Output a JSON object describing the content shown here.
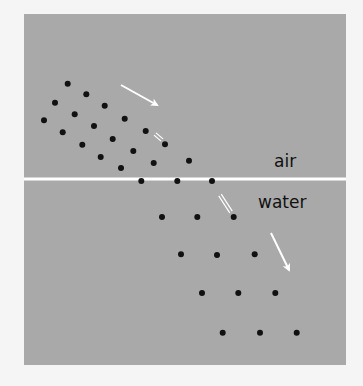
{
  "diagram": {
    "title": "",
    "panel": {
      "x": 24,
      "y": 14,
      "width": 322,
      "height": 351,
      "color": "#a9a9a9"
    },
    "interface": {
      "y": 179,
      "color": "#ffffff",
      "thickness": 3
    },
    "labels": {
      "upper_medium": "air",
      "lower_medium": "water"
    },
    "colors": {
      "background": "#f5f5f5",
      "dot": "#111111",
      "arrow": "#ffffff"
    },
    "air_wave_dots": [
      [
        67.7,
        83.7
      ],
      [
        86.3,
        94.3
      ],
      [
        104.7,
        105.7
      ],
      [
        124.7,
        118.7
      ],
      [
        145.7,
        131.0
      ],
      [
        165.0,
        144.3
      ],
      [
        189.0,
        160.7
      ],
      [
        55.0,
        102.7
      ],
      [
        74.7,
        114.3
      ],
      [
        94.0,
        126.0
      ],
      [
        112.7,
        139.0
      ],
      [
        133.3,
        151.0
      ],
      [
        153.7,
        163.0
      ],
      [
        44.0,
        120.3
      ],
      [
        62.7,
        132.3
      ],
      [
        82.3,
        144.7
      ],
      [
        100.7,
        157.0
      ],
      [
        121.0,
        168.0
      ]
    ],
    "interface_dots": [
      [
        141.3,
        181.0
      ],
      [
        177.3,
        181.0
      ],
      [
        212.0,
        181.0
      ]
    ],
    "water_wave_dots": [
      [
        162.0,
        217.0
      ],
      [
        197.3,
        217.0
      ],
      [
        233.7,
        217.0
      ],
      [
        181.0,
        254.3
      ],
      [
        217.0,
        255.0
      ],
      [
        254.7,
        254.3
      ],
      [
        202.0,
        293.0
      ],
      [
        238.3,
        293.0
      ],
      [
        275.3,
        293.0
      ],
      [
        222.7,
        332.7
      ],
      [
        260.0,
        332.7
      ],
      [
        296.7,
        332.7
      ]
    ],
    "arrows": [
      {
        "name": "incident-ray-arrow",
        "x1": 121,
        "y1": 85,
        "x2": 157,
        "y2": 105
      },
      {
        "name": "refracted-ray-arrow",
        "x1": 271,
        "y1": 233,
        "x2": 289,
        "y2": 270
      }
    ],
    "dashes": [
      {
        "name": "incident-dash",
        "x1": 155,
        "y1": 134,
        "x2": 162,
        "y2": 140
      },
      {
        "name": "refracted-dash",
        "x1": 220,
        "y1": 195,
        "x2": 231,
        "y2": 212
      }
    ]
  }
}
